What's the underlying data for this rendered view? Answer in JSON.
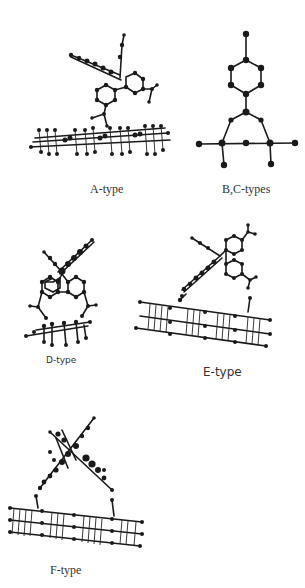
{
  "figure": {
    "panels": [
      {
        "id": "A",
        "label": "A-type"
      },
      {
        "id": "BC",
        "label": "B,C-types"
      },
      {
        "id": "D",
        "label": "D-type"
      },
      {
        "id": "E",
        "label": "E-type"
      },
      {
        "id": "F",
        "label": "F-type"
      }
    ]
  },
  "colors": {
    "background": "#ffffff",
    "atoms": "#1a1a1a",
    "text": "#333333"
  }
}
